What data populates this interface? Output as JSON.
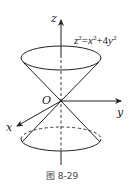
{
  "figure": {
    "equation": {
      "lhs_var": "z",
      "lhs_exp": "2",
      "eq": "=",
      "t1_var": "x",
      "t1_exp": "2",
      "plus": "+",
      "t2_coef": "4",
      "t2_var": "y",
      "t2_exp": "2"
    },
    "axes": {
      "x_label": "x",
      "y_label": "y",
      "z_label": "z",
      "origin_label": "O"
    },
    "caption": "图 8-29",
    "colors": {
      "stroke": "#222222",
      "background": "#ffffff"
    }
  }
}
